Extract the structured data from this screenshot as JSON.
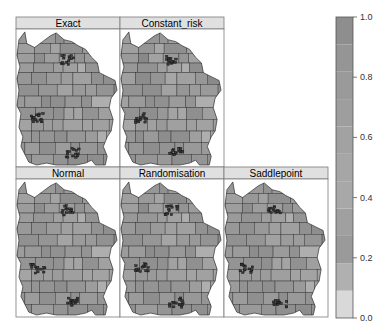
{
  "chart_data": {
    "type": "heatmap",
    "subtype": "choropleth-map-panels",
    "title": "",
    "panels": [
      {
        "name": "Exact",
        "row": 1,
        "col": 1
      },
      {
        "name": "Constant_risk",
        "row": 1,
        "col": 2
      },
      {
        "name": "Normal",
        "row": 2,
        "col": 1
      },
      {
        "name": "Randomisation",
        "row": 2,
        "col": 2
      },
      {
        "name": "Saddlepoint",
        "row": 2,
        "col": 3
      }
    ],
    "colorbar": {
      "range": [
        0.0,
        1.0
      ],
      "ticks": [
        0.0,
        0.2,
        0.4,
        0.6,
        0.8,
        1.0
      ],
      "tick_labels": [
        "0.0",
        "0.2",
        "0.4",
        "0.6",
        "0.8",
        "1.0"
      ],
      "colors": [
        "#d9d9d9",
        "#b0b0b0",
        "#9a9a9a",
        "#a0a0a0",
        "#a8a8a8",
        "#a6a6a6",
        "#a2a2a2",
        "#9e9e9e",
        "#9a9a9a",
        "#959595",
        "#8e8e8e"
      ],
      "placement": "right"
    },
    "xlabel": "",
    "ylabel": "",
    "grid": false
  }
}
